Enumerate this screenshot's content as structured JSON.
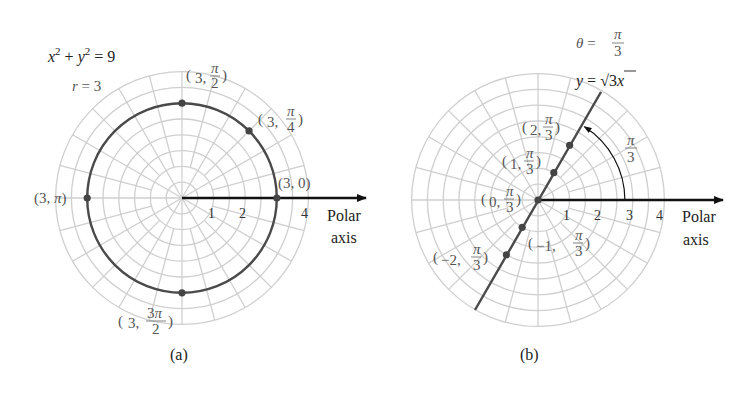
{
  "colors": {
    "grid": "#cfcfcf",
    "curve": "#4a4a4a",
    "axis": "#111111",
    "point": "#444444",
    "label": "#555555"
  },
  "panels": [
    {
      "id": "a",
      "caption": "(a)",
      "center": [
        182,
        198
      ],
      "unit_px": 31.6,
      "grid_rings": 8,
      "ring_step": 0.5,
      "axis_end_x": 366,
      "axis_label_lines": [
        "Polar",
        "axis"
      ],
      "axis_label_pos": [
        327,
        221
      ],
      "ticks": [
        {
          "label": "1",
          "x": 212
        },
        {
          "label": "2",
          "x": 243
        },
        {
          "label": "4",
          "x": 305
        }
      ],
      "equation": "x² + y² = 9",
      "equation_parts": {
        "x": "x",
        "exp1": "2",
        "plus": " + ",
        "y": "y",
        "exp2": "2",
        "eq": " = 9"
      },
      "equation_pos": [
        48,
        62
      ],
      "curve_label": {
        "r": "r",
        "rest": " = 3",
        "pos": [
          72,
          91
        ]
      },
      "curve": {
        "type": "circle",
        "r": 3
      },
      "points": [
        {
          "label": "(3, 0)",
          "r": 3,
          "theta_deg": 0
        },
        {
          "label": "(3, π/4)",
          "r": 3,
          "theta_deg": 45
        },
        {
          "label": "(3, π/2)",
          "r": 3,
          "theta_deg": 90
        },
        {
          "label": "(3, π)",
          "r": 3,
          "theta_deg": 180
        },
        {
          "label": "(3, 3π/2)",
          "r": 3,
          "theta_deg": 270
        }
      ]
    },
    {
      "id": "b",
      "caption": "(b)",
      "center": [
        538,
        200
      ],
      "unit_px": 31.6,
      "grid_rings": 8,
      "ring_step": 0.5,
      "axis_end_x": 723,
      "axis_label_lines": [
        "Polar",
        "axis"
      ],
      "axis_label_pos": [
        682,
        222
      ],
      "ticks": [
        {
          "label": "1",
          "x": 567
        },
        {
          "label": "2",
          "x": 598
        },
        {
          "label": "3",
          "x": 630
        },
        {
          "label": "4",
          "x": 660
        }
      ],
      "equation_theta": {
        "theta": "θ",
        "eq": " = ",
        "num": "π",
        "den": "3"
      },
      "equation_theta_pos": [
        576,
        47
      ],
      "equation_line": {
        "y": "y",
        "eq": " = ",
        "sqrt": "√3",
        "x": "x"
      },
      "equation_line_pos": [
        576,
        86
      ],
      "curve": {
        "type": "line",
        "theta_deg": 60,
        "from": [
          475,
          310
        ],
        "to": [
          601,
          92
        ]
      },
      "angle_arc": {
        "radius_units": 2.75,
        "label_num": "π",
        "label_den": "3",
        "label_pos": [
          628,
          143
        ]
      },
      "points": [
        {
          "label": "(2, π/3)",
          "r": 2,
          "theta_deg": 60
        },
        {
          "label": "(1, π/3)",
          "r": 1,
          "theta_deg": 60
        },
        {
          "label": "(0, π/3)",
          "r": 0,
          "theta_deg": 60
        },
        {
          "label": "(−1, π/3)",
          "r": -1,
          "theta_deg": 60
        },
        {
          "label": "(−2, π/3)",
          "r": -2,
          "theta_deg": 60
        }
      ]
    }
  ]
}
